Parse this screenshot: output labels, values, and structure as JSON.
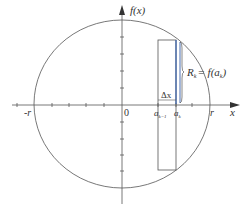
{
  "diagram": {
    "type": "circle-cross-section",
    "axes": {
      "y_label": "f(x)",
      "x_label": "x",
      "origin_label": "0",
      "neg_r_label": "-r",
      "pos_r_label": "r"
    },
    "annotations": {
      "delta_x": "Δx",
      "a_prev": "a",
      "a_prev_sub": "k−1",
      "a_k": "a",
      "a_k_sub": "k",
      "radius_eq_R": "R",
      "radius_eq_R_sub": "k",
      "radius_eq_rhs": "= f(a",
      "radius_eq_rhs_sub": "k",
      "radius_eq_close": ")"
    },
    "colors": {
      "stroke": "#555555",
      "highlight": "#4a6fb0",
      "text": "#333333"
    }
  }
}
